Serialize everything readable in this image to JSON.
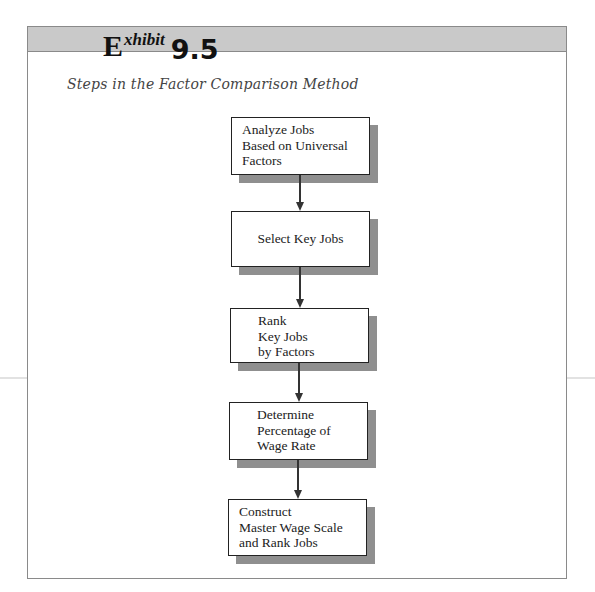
{
  "exhibit": {
    "letter": "E",
    "superscript": "xhibit",
    "number": "9.5"
  },
  "subtitle": "Steps in the Factor Comparison Method",
  "colors": {
    "header_band": "#c9c9c9",
    "frame_border": "#8a8a8a",
    "box_border": "#222222",
    "box_shadow": "#8f8f8f",
    "connector": "#333333",
    "subtitle_text": "#444444"
  },
  "flowchart": {
    "steps": [
      {
        "label": "Analyze Jobs\nBased on Universal\nFactors"
      },
      {
        "label": "Select Key Jobs"
      },
      {
        "label": "Rank\nKey Jobs\nby Factors"
      },
      {
        "label": "Determine\nPercentage of\nWage Rate"
      },
      {
        "label": "Construct\nMaster Wage Scale\nand Rank Jobs"
      }
    ]
  }
}
